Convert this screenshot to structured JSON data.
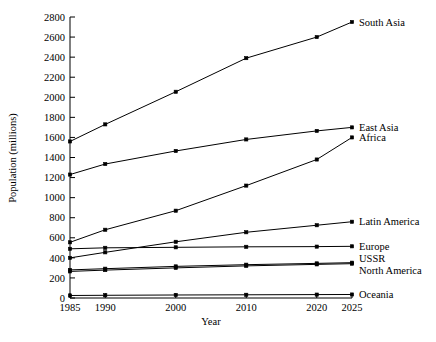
{
  "chart_data": {
    "type": "line",
    "title": "",
    "xlabel": "Year",
    "ylabel": "Population (millions)",
    "x": [
      1985,
      1990,
      2000,
      2010,
      2020,
      2025
    ],
    "xtick_labels": [
      "1985",
      "1990",
      "2000",
      "2010",
      "2020",
      "2025"
    ],
    "xlim": [
      1985,
      2025
    ],
    "ylim": [
      0,
      2800
    ],
    "ytick_labels": [
      "0",
      "200",
      "400",
      "600",
      "800",
      "1000",
      "1200",
      "1400",
      "1600",
      "1800",
      "2000",
      "2200",
      "2400",
      "2600",
      "2800"
    ],
    "yticks": [
      0,
      200,
      400,
      600,
      800,
      1000,
      1200,
      1400,
      1600,
      1800,
      2000,
      2200,
      2400,
      2600,
      2800
    ],
    "grid": false,
    "legend_position": "right-inline",
    "marker": "dot",
    "line_color": "#000000",
    "series": [
      {
        "name": "South Asia",
        "values": [
          1560,
          1730,
          2055,
          2390,
          2600,
          2750
        ]
      },
      {
        "name": "East Asia",
        "values": [
          1230,
          1335,
          1465,
          1580,
          1665,
          1700
        ]
      },
      {
        "name": "Africa",
        "values": [
          555,
          680,
          870,
          1120,
          1380,
          1600
        ]
      },
      {
        "name": "Latin America",
        "values": [
          400,
          455,
          560,
          655,
          725,
          760
        ]
      },
      {
        "name": "Europe",
        "values": [
          490,
          500,
          505,
          510,
          512,
          515
        ]
      },
      {
        "name": "USSR",
        "values": [
          280,
          292,
          315,
          332,
          345,
          352
        ]
      },
      {
        "name": "North America",
        "values": [
          265,
          278,
          300,
          320,
          335,
          342
        ]
      },
      {
        "name": "Oceania",
        "values": [
          25,
          27,
          30,
          32,
          34,
          35
        ]
      }
    ]
  }
}
